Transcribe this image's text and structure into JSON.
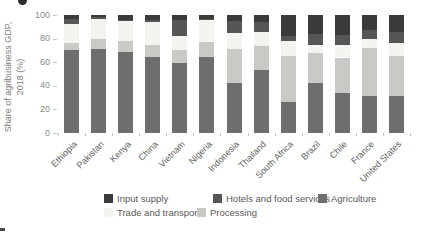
{
  "figure": {
    "y_axis_title_line1": "Share of agribusiness GDP,",
    "y_axis_title_line2": "2018 (%)"
  },
  "chart_data": {
    "type": "bar",
    "stacked": true,
    "title": "",
    "xlabel": "",
    "ylabel": "Share of agribusiness GDP, 2018 (%)",
    "ylim": [
      0,
      100
    ],
    "yticks": [
      0,
      20,
      40,
      60,
      80,
      100
    ],
    "grid": false,
    "legend_position": "bottom",
    "categories": [
      "Ethiopia",
      "Pakistan",
      "Kenya",
      "China",
      "Vietnam",
      "Nigeria",
      "Indonesia",
      "Thailand",
      "South Africa",
      "Brazil",
      "Chile",
      "France",
      "United States"
    ],
    "series": [
      {
        "name": "Agriculture",
        "color": "#6e6e6e",
        "values": [
          70,
          71,
          69,
          64,
          59,
          64,
          42,
          53,
          26,
          42,
          34,
          31,
          31
        ]
      },
      {
        "name": "Processing",
        "color": "#c9c9c6",
        "values": [
          6,
          9,
          9,
          11,
          11,
          13,
          29,
          21,
          39,
          26,
          30,
          41,
          34
        ]
      },
      {
        "name": "Trade and transport",
        "color": "#f3f3f0",
        "values": [
          16,
          17,
          17,
          19,
          12,
          19,
          14,
          12,
          13,
          7,
          11,
          8,
          11
        ]
      },
      {
        "name": "Hotels and food services",
        "color": "#565656",
        "values": [
          5,
          1,
          1,
          2,
          14,
          1,
          10,
          8,
          4,
          9,
          8,
          7,
          10
        ]
      },
      {
        "name": "Input supply",
        "color": "#3a3a3a",
        "values": [
          3,
          2,
          4,
          4,
          4,
          3,
          5,
          6,
          18,
          16,
          17,
          13,
          14
        ]
      }
    ],
    "legend_rows": [
      [
        "Input supply",
        "Hotels and food services",
        "Agriculture"
      ],
      [
        "Trade and transport",
        "Processing"
      ]
    ]
  }
}
